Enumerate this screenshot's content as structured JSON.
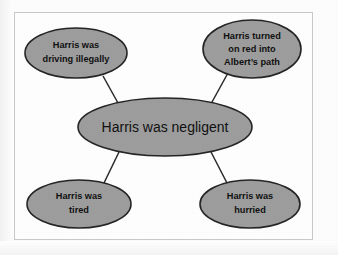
{
  "diagram": {
    "type": "concept-map",
    "colors": {
      "node_fill": "#9d9d9d",
      "node_stroke": "#252525",
      "connector": "#2a2a2a",
      "frame_border": "#c9c9c9",
      "canvas_background": "#fefefe",
      "text": "#111111"
    },
    "central_node": {
      "id": "central-claim",
      "label": "Harris was negligent",
      "lines": [
        "Harris was negligent"
      ],
      "cx": 165,
      "cy": 127,
      "rx": 87,
      "ry": 29
    },
    "satellite_nodes": [
      {
        "id": "driving-illegally",
        "label": "Harris was driving illegally",
        "lines": [
          "Harris was",
          "driving illegally"
        ],
        "position": "top-left",
        "cx": 76,
        "cy": 53,
        "rx": 51,
        "ry": 25
      },
      {
        "id": "turned-on-red",
        "label": "Harris turned on red into Albert’s path",
        "lines": [
          "Harris turned",
          "on red into",
          "Albert’s path"
        ],
        "position": "top-right",
        "cx": 252,
        "cy": 49,
        "rx": 49,
        "ry": 29
      },
      {
        "id": "was-tired",
        "label": "Harris was tired",
        "lines": [
          "Harris was",
          "tired"
        ],
        "position": "bottom-left",
        "cx": 79,
        "cy": 204,
        "rx": 52,
        "ry": 24
      },
      {
        "id": "was-hurried",
        "label": "Harris was hurried",
        "lines": [
          "Harris was",
          "hurried"
        ],
        "position": "bottom-right",
        "cx": 250,
        "cy": 204,
        "rx": 50,
        "ry": 24
      }
    ],
    "connectors": [
      {
        "id": "central-to-driving-illegally",
        "from": "central-claim",
        "to": "driving-illegally",
        "x1": 118,
        "y1": 103,
        "x2": 103,
        "y2": 76
      },
      {
        "id": "central-to-turned-on-red",
        "from": "central-claim",
        "to": "turned-on-red",
        "x1": 212,
        "y1": 102,
        "x2": 228,
        "y2": 73
      },
      {
        "id": "central-to-was-tired",
        "from": "central-claim",
        "to": "was-tired",
        "x1": 119,
        "y1": 152,
        "x2": 104,
        "y2": 183
      },
      {
        "id": "central-to-was-hurried",
        "from": "central-claim",
        "to": "was-hurried",
        "x1": 211,
        "y1": 152,
        "x2": 227,
        "y2": 183
      }
    ]
  }
}
